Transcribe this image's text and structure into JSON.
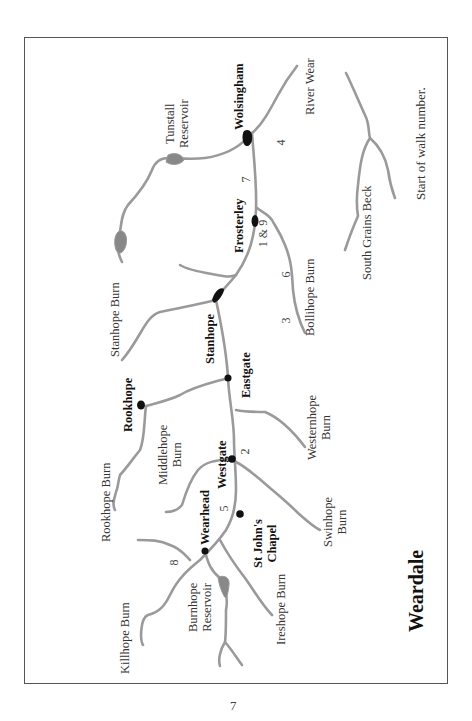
{
  "map": {
    "title": "Weardale",
    "legend": "Start of walk number.",
    "towns": [
      {
        "name": "Wolsingham"
      },
      {
        "name": "Frosterley"
      },
      {
        "name": "Stanhope"
      },
      {
        "name": "Eastgate"
      },
      {
        "name": "Rookhope"
      },
      {
        "name": "Westgate"
      },
      {
        "name": "St John's",
        "line2": "Chapel"
      },
      {
        "name": "Wearhead"
      }
    ],
    "waters": [
      {
        "name": "Tunstall",
        "line2": "Reservoir"
      },
      {
        "name": "River Wear"
      },
      {
        "name": "Stanhope Burn"
      },
      {
        "name": "Bollihope Burn"
      },
      {
        "name": "South Grains Beck"
      },
      {
        "name": "Middlehope",
        "line2": "Burn"
      },
      {
        "name": "Westernhope",
        "line2": "Burn"
      },
      {
        "name": "Rookhope Burn"
      },
      {
        "name": "Swinhope",
        "line2": "Burn"
      },
      {
        "name": "Killhope Burn"
      },
      {
        "name": "Burnhope",
        "line2": "Reservoir"
      },
      {
        "name": "Ireshope Burn"
      }
    ],
    "walk_numbers": [
      "4",
      "7",
      "1 & 9",
      "6",
      "3",
      "2",
      "5",
      "8"
    ],
    "colors": {
      "river": "#9a9a9a",
      "town": "#111111",
      "frame": "#555555"
    }
  },
  "page": {
    "number": "7"
  }
}
